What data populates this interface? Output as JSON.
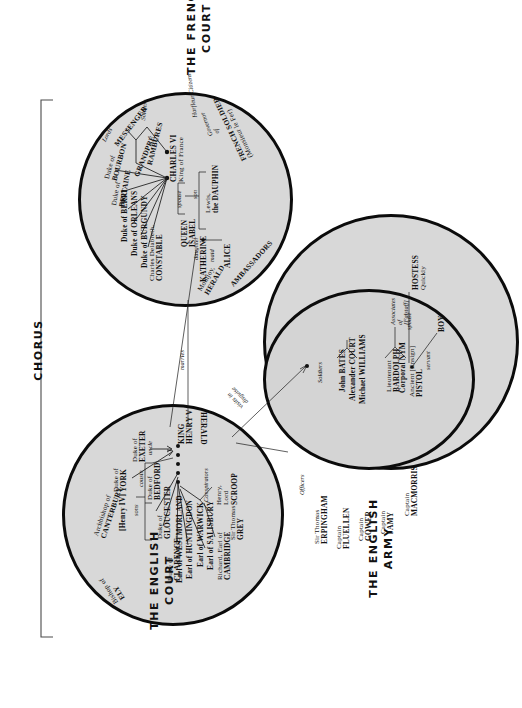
{
  "groups": {
    "chorus": "CHORUS",
    "french_court": "THE FRENCH\nCOURT",
    "english_court": "THE ENGLISH\nCOURT",
    "english_army": "THE ENGLISH\nARMY"
  },
  "captions": {
    "french_court_l1": "THE FRENCH",
    "french_court_l2": "COURT",
    "english_court_l1": "THE ENGLISH",
    "english_court_l2": "COURT",
    "english_army_l1": "THE ENGLISH",
    "english_army_l2": "ARMY",
    "chorus": "CHORUS"
  },
  "french_court": {
    "king_name": "CHARLES VI",
    "king_title": "King of France",
    "queen_l1": "QUEEN",
    "queen_l2": "ISABEL",
    "dauphin_l1": "Lewis,",
    "dauphin_l2": "the DAUPHIN",
    "katherine": "KATHERINE",
    "alice": "ALICE",
    "rel_spouse": "spouse",
    "rel_son": "son",
    "rel_daughter": "daughter",
    "rel_maid": "maid",
    "nobles": [
      "Duke of\nBOURBON",
      "Duke of\nBRITAINE",
      "Duke of BERRI",
      "Duke of ORLEANS",
      "Duke of BURGUNDY",
      "Charles Delabreth,\nCONSTABLE"
    ],
    "noble_bourbon_l1": "Duke of",
    "noble_bourbon_l2": "BOURBON",
    "noble_britaine_l1": "Duke of",
    "noble_britaine_l2": "BRITAINE",
    "noble_berri": "Duke of BERRI",
    "noble_orleans": "Duke of ORLEANS",
    "noble_burgundy": "Duke of BURGUNDY",
    "constable_l1": "Charles Delabreth,",
    "constable_l2": "CONSTABLE",
    "grandpre": "GRANDPRÉ",
    "rambures": "RAMBURES",
    "messenger": "MESSENGER",
    "lords": "Lords",
    "soldiers": "Soldiers",
    "harfleur_citizens": "Harfleur Citizens",
    "governor_l1": "Governor",
    "governor_l2": "of",
    "french_soldier_l1": "FRENCH SOLDIER",
    "french_soldier_l2": "(Monsieur le Fer)",
    "montjoy_l1": "Montjoy,",
    "montjoy_l2": "HERALD",
    "ambassadors": "AMBASSADORS"
  },
  "english_court": {
    "king_l1": "KING",
    "king_l2": "HENRY V",
    "herald": "HERALD",
    "exeter_l1": "Duke of",
    "exeter_l2": "EXETER",
    "york_l1": "Duke of",
    "york_l2": "YORK",
    "henry_iv": "[Henry IV]",
    "bedford_l1": "Duke of",
    "bedford_l2": "BEDFORD",
    "gloucester_l1": "Duke of",
    "gloucester_l2": "GLOUCESTER",
    "clarence_l1": "Duke of",
    "clarence_l2": "CLARENCE",
    "westmorland": "Earl of WESTMORLAND",
    "huntingdon": "Earl of HUNTINGDON",
    "warwick": "Earl of WARWICK",
    "salisbury": "Earl of SALISBURY",
    "cambridge_l1": "Richard, Earl of",
    "cambridge_l2": "CAMBRIDGE",
    "scroop_l1": "Henry,",
    "scroop_l2": "Lord",
    "scroop_l3": "SCROOP",
    "grey_l1": "Sir Thomas",
    "grey_l2": "GREY",
    "conspirators": "Conspirators",
    "canterbury_l1": "Archbishop of",
    "canterbury_l2": "CANTERBURY",
    "ely_l1": "Bishop of",
    "ely_l2": "ELY",
    "rel_uncle": "uncle",
    "rel_cousin": "cousin",
    "rel_sons": "sons"
  },
  "english_army": {
    "officers": "Officers",
    "erpingham_l1": "Sir Thomas",
    "erpingham_l2": "ERPINGHAM",
    "fluellen_l1": "Captain",
    "fluellen_l2": "FLUELLEN",
    "gower_l1": "Captain",
    "gower_l2": "GOWER",
    "jamy_l1": "Captain",
    "jamy_l2": "JAMY",
    "macmorris_l1": "Captain",
    "macmorris_l2": "MACMORRIS",
    "soldiers": "Soldiers",
    "bates": "John BATES",
    "court": "Alexander COURT",
    "williams": "Michael WILLIAMS",
    "bardolph_l1": "Lieutenant",
    "bardolph_l2": "BARDOLPH",
    "nym": "Corporal NYM",
    "pistol_l1": "Ancient [Ensign]",
    "pistol_l2": "PISTOL",
    "associates_l1": "Associates",
    "associates_l2": "of",
    "associates_l3": "[Falstaff]",
    "hostess_l1": "HOSTESS",
    "hostess_l2": "Quickly",
    "boy": "BOY",
    "rel_spouse": "spouse",
    "rel_servant": "servant"
  },
  "connectors": {
    "marries": "marries",
    "visits_l1": "visits in",
    "visits_l2": "disguise"
  },
  "colors": {
    "circle_fill": "#d8d8d8",
    "circle_stroke": "#0b0b0b",
    "text": "#111111",
    "background": "#ffffff"
  }
}
